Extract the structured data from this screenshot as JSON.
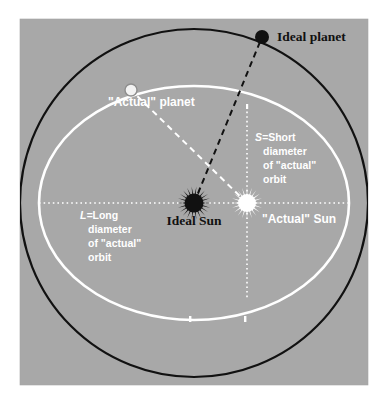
{
  "figure": {
    "panel": {
      "background_color": "#a8a8a8",
      "page_background_color": "#ffffff",
      "x": 20,
      "y": 19,
      "width": 348,
      "height": 366
    },
    "colors": {
      "ideal_stroke": "#111111",
      "actual_stroke": "#ffffff",
      "panel_gray": "#a8a8a8",
      "marker_outline": "#8e8e8e"
    },
    "geometry": {
      "center": {
        "x": 194,
        "y": 203
      },
      "ideal_circle": {
        "cx": 194,
        "cy": 203,
        "r": 174,
        "stroke_width": 2.2
      },
      "actual_ellipse": {
        "cx": 194,
        "cy": 203,
        "rx": 155,
        "ry": 117,
        "stroke_width": 2.6
      },
      "horizontal_axis": {
        "x1": 39,
        "y1": 203,
        "x2": 349,
        "y2": 203
      },
      "vertical_axis": {
        "x": 247,
        "y1": 107,
        "y2": 299
      },
      "ideal_sun": {
        "cx": 194,
        "cy": 203,
        "r": 9,
        "spikes": 22
      },
      "actual_sun": {
        "cx": 247,
        "cy": 203,
        "r": 8.5,
        "spikes": 20
      },
      "ideal_planet": {
        "cx": 262,
        "cy": 37,
        "r": 7
      },
      "actual_planet": {
        "cx": 131,
        "cy": 90,
        "r": 6
      },
      "ideal_radius_line": {
        "x1": 194,
        "y1": 203,
        "x2": 262,
        "y2": 37
      },
      "actual_radius_line": {
        "x1": 247,
        "y1": 203,
        "x2": 131,
        "y2": 90
      },
      "ellipse_ticks": [
        {
          "x": 190,
          "y": 320
        },
        {
          "x": 245,
          "y": 320
        }
      ]
    },
    "labels": {
      "ideal_planet": "Ideal planet",
      "actual_planet": "\"Actual\" planet",
      "ideal_sun": "Ideal Sun",
      "actual_sun": "\"Actual\" Sun",
      "short_diameter": {
        "line1_symbol": "S=",
        "line1_rest": "Short",
        "line2": "diameter",
        "line3": "of \"actual\"",
        "line4": "orbit"
      },
      "long_diameter": {
        "line1_symbol": "L=",
        "line1_rest": "Long",
        "line2": "diameter",
        "line3": "of \"actual\"",
        "line4": "orbit"
      }
    }
  }
}
